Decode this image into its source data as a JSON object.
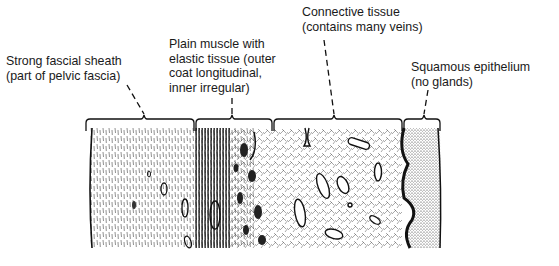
{
  "figure": {
    "labels": [
      {
        "id": "fascia",
        "lines": [
          "Strong fascial sheath",
          "(part of pelvic fascia)"
        ]
      },
      {
        "id": "muscle",
        "lines": [
          "Plain muscle with",
          "elastic tissue (outer",
          "coat longitudinal,",
          "inner irregular)"
        ]
      },
      {
        "id": "connective",
        "lines": [
          "Connective tissue",
          "(contains many veins)"
        ]
      },
      {
        "id": "epithelium",
        "lines": [
          "Squamous epithelium",
          "(no glands)"
        ]
      }
    ]
  },
  "colors": {
    "ink": "#1a1a1a",
    "paper": "#ffffff"
  }
}
